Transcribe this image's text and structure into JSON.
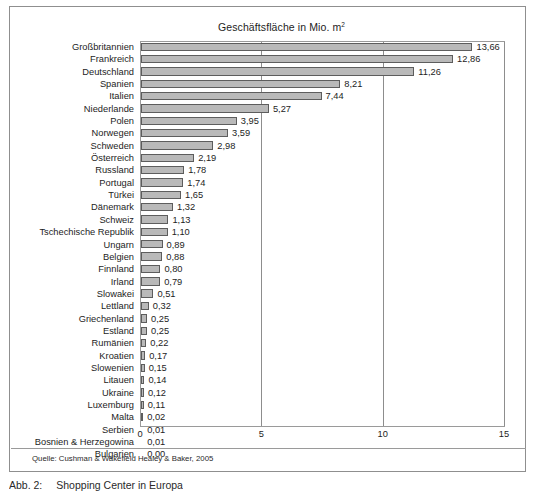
{
  "figure": {
    "title": "Geschäftsfläche in Mio. m",
    "title_superscript": "2",
    "source_note": "Quelle: Cushman & Wakefield Healey & Baker, 2005",
    "caption_number": "Abb. 2:",
    "caption_text": "Shopping Center in Europa"
  },
  "colors": {
    "bar_fill": "#b9b9b9",
    "bar_border": "#5d5d5d",
    "axis": "#9a9a9a",
    "frame": "#8f8f8f",
    "text": "#1d1d1d"
  },
  "chart_data": {
    "type": "bar",
    "orientation": "horizontal",
    "xlabel": "",
    "ylabel": "",
    "xlim": [
      0,
      15
    ],
    "xticks": [
      "0",
      "5",
      "10",
      "15"
    ],
    "xtick_values": [
      0,
      5,
      10,
      15
    ],
    "grid": true,
    "legend": "none",
    "value_label_format": "comma-decimal",
    "source": "Cushman & Wakefield Healey & Baker, 2005",
    "categories": [
      "Großbritannien",
      "Frankreich",
      "Deutschland",
      "Spanien",
      "Italien",
      "Niederlande",
      "Polen",
      "Norwegen",
      "Schweden",
      "Österreich",
      "Russland",
      "Portugal",
      "Türkei",
      "Dänemark",
      "Schweiz",
      "Tschechische Republik",
      "Ungarn",
      "Belgien",
      "Finnland",
      "Irland",
      "Slowakei",
      "Lettland",
      "Griechenland",
      "Estland",
      "Rumänien",
      "Kroatien",
      "Slowenien",
      "Litauen",
      "Ukraine",
      "Luxemburg",
      "Malta",
      "Serbien",
      "Bosnien & Herzegowina",
      "Bulgarien"
    ],
    "values": [
      13.66,
      12.86,
      11.26,
      8.21,
      7.44,
      5.27,
      3.95,
      3.59,
      2.98,
      2.19,
      1.78,
      1.74,
      1.65,
      1.32,
      1.13,
      1.1,
      0.89,
      0.88,
      0.8,
      0.79,
      0.51,
      0.32,
      0.25,
      0.25,
      0.22,
      0.17,
      0.15,
      0.14,
      0.12,
      0.11,
      0.02,
      0.01,
      0.01,
      0.0
    ],
    "value_labels": [
      "13,66",
      "12,86",
      "11,26",
      "8,21",
      "7,44",
      "5,27",
      "3,95",
      "3,59",
      "2,98",
      "2,19",
      "1,78",
      "1,74",
      "1,65",
      "1,32",
      "1,13",
      "1,10",
      "0,89",
      "0,88",
      "0,80",
      "0,79",
      "0,51",
      "0,32",
      "0,25",
      "0,25",
      "0,22",
      "0,17",
      "0,15",
      "0,14",
      "0,12",
      "0,11",
      "0,02",
      "0,01",
      "0,01",
      "0,00"
    ]
  }
}
